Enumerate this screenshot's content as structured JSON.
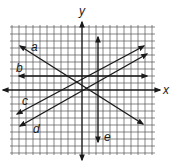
{
  "diagram": {
    "type": "coordinate-plane",
    "axes": {
      "x_label": "x",
      "y_label": "y"
    },
    "grid": {
      "visible": true,
      "color": "#555555"
    },
    "line_color": "#1a1a1a",
    "lines": [
      {
        "label": "a",
        "description": "negative slope line, upper-left to lower-right"
      },
      {
        "label": "b",
        "description": "horizontal line above x-axis"
      },
      {
        "label": "c",
        "description": "positive slope line"
      },
      {
        "label": "d",
        "description": "positive slope line parallel to c"
      },
      {
        "label": "e",
        "description": "vertical line right of y-axis"
      }
    ]
  },
  "labels": {
    "x": "x",
    "y": "y",
    "a": "a",
    "b": "b",
    "c": "c",
    "d": "d",
    "e": "e"
  }
}
